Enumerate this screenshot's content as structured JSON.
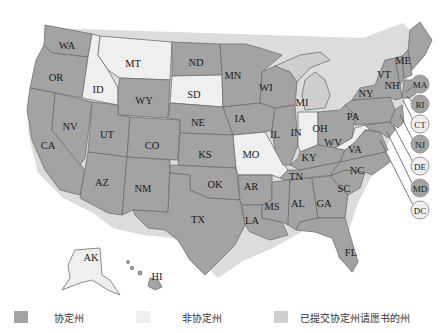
{
  "colors": {
    "compact": "#a3a3a3",
    "non_compact": "#efefef",
    "petition": "#cfcfcf",
    "shadow": "#d9d9d9"
  },
  "legend": [
    {
      "key": "compact",
      "label": "协定州",
      "color": "#a3a3a3"
    },
    {
      "key": "non_compact",
      "label": "非协定州",
      "color": "#efefef"
    },
    {
      "key": "petition",
      "label": "已提交协定州请愿书的州",
      "color": "#cfcfcf"
    }
  ],
  "states": {
    "WA": "compact",
    "OR": "compact",
    "CA": "compact",
    "NV": "compact",
    "ID": "non_compact",
    "MT": "non_compact",
    "WY": "compact",
    "UT": "compact",
    "AZ": "compact",
    "CO": "compact",
    "NM": "compact",
    "ND": "compact",
    "SD": "non_compact",
    "NE": "compact",
    "KS": "compact",
    "OK": "compact",
    "TX": "compact",
    "MN": "compact",
    "IA": "compact",
    "MO": "non_compact",
    "AR": "compact",
    "LA": "compact",
    "WI": "compact",
    "IL": "compact",
    "MI": "petition",
    "IN": "non_compact",
    "OH": "compact",
    "KY": "compact",
    "TN": "compact",
    "MS": "compact",
    "AL": "compact",
    "GA": "compact",
    "FL": "compact",
    "SC": "compact",
    "NC": "compact",
    "VA": "compact",
    "WV": "non_compact",
    "PA": "compact",
    "NY": "compact",
    "VT": "compact",
    "NH": "compact",
    "ME": "compact",
    "AK": "non_compact",
    "HI": "compact"
  },
  "labels": {
    "WA": "WA",
    "OR": "OR",
    "CA": "CA",
    "NV": "NV",
    "ID": "ID",
    "MT": "MT",
    "WY": "WY",
    "UT": "UT",
    "AZ": "AZ",
    "CO": "CO",
    "NM": "NM",
    "ND": "ND",
    "SD": "SD",
    "NE": "NE",
    "KS": "KS",
    "OK": "OK",
    "TX": "TX",
    "MN": "MN",
    "IA": "IA",
    "MO": "MO",
    "AR": "AR",
    "LA": "LA",
    "WI": "WI",
    "IL": "IL",
    "MI": "MI",
    "IN": "IN",
    "OH": "OH",
    "KY": "KY",
    "TN": "TN",
    "MS": "MS",
    "AL": "AL",
    "GA": "GA",
    "FL": "FL",
    "SC": "SC",
    "NC": "NC",
    "VA": "VA",
    "WV": "WV",
    "PA": "PA",
    "NY": "NY",
    "VT": "VT",
    "NH": "NH",
    "ME": "ME",
    "AK": "AK",
    "HI": "HI"
  },
  "callouts": [
    {
      "code": "MA",
      "label": "MA",
      "status": "compact"
    },
    {
      "code": "RI",
      "label": "RI",
      "status": "compact"
    },
    {
      "code": "CT",
      "label": "CT",
      "status": "non_compact"
    },
    {
      "code": "NJ",
      "label": "NJ",
      "status": "compact"
    },
    {
      "code": "DE",
      "label": "DE",
      "status": "non_compact"
    },
    {
      "code": "MD",
      "label": "MD",
      "status": "compact"
    },
    {
      "code": "DC",
      "label": "DC",
      "status": "non_compact"
    }
  ]
}
